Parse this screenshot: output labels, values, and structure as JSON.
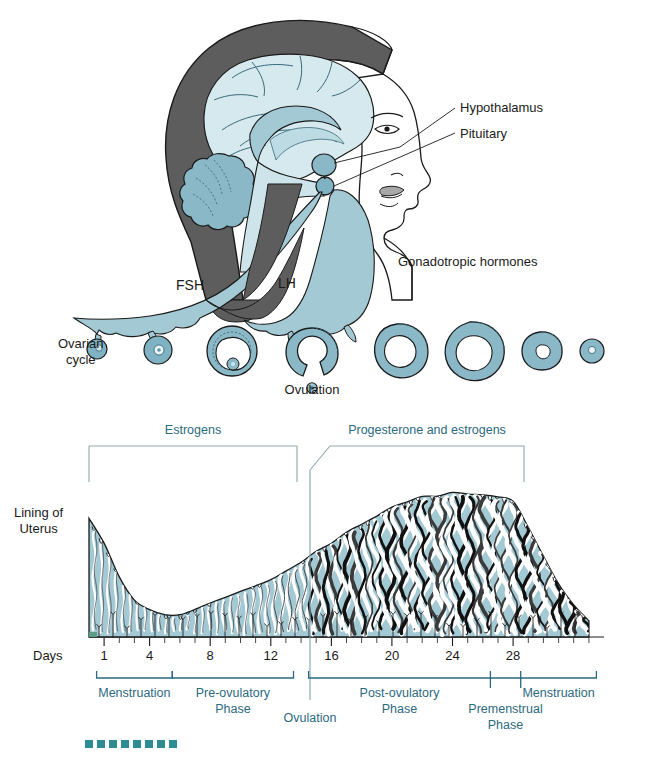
{
  "figure": {
    "colors": {
      "teal_fill": "#a3c9d4",
      "teal_mid": "#8ab8c6",
      "teal_dark": "#5d96a8",
      "brain_light": "#d6e9ef",
      "hair_gray": "#5d5d5d",
      "lip_gray": "#a8a8a8",
      "outline": "#1a1a1a",
      "label_blue": "#2b6a80",
      "bracket_gray": "#8fa8ae",
      "gland_black": "#111111"
    }
  },
  "upper_panel": {
    "labels": {
      "hypothalamus": "Hypothalamus",
      "pituitary": "Pituitary",
      "gonadotropic_hormones": "Gonadotropic hormones",
      "fsh": "FSH",
      "lh": "LH",
      "ovarian_cycle_line1": "Ovarian",
      "ovarian_cycle_line2": "cycle",
      "ovulation": "Ovulation"
    },
    "follicles": [
      {
        "stage": "primordial-follicle",
        "cx": 97,
        "r": 10
      },
      {
        "stage": "primary-follicle",
        "cx": 158,
        "r": 14
      },
      {
        "stage": "mature-graafian-follicle",
        "cx": 232,
        "r": 25
      },
      {
        "stage": "ruptured-follicle-ovulation",
        "cx": 312,
        "r": 24
      },
      {
        "stage": "early-corpus-luteum",
        "cx": 397,
        "r": 27
      },
      {
        "stage": "mature-corpus-luteum",
        "cx": 470,
        "r": 29
      },
      {
        "stage": "regressing-corpus-luteum",
        "cx": 540,
        "r": 20
      },
      {
        "stage": "corpus-albicans",
        "cx": 592,
        "r": 12
      }
    ]
  },
  "lower_panel": {
    "labels": {
      "lining_line1": "Lining of",
      "lining_line2": "Uterus",
      "estrogens": "Estrogens",
      "progesterone_and_estrogens": "Progesterone and estrogens",
      "days": "Days",
      "ovulation": "Ovulation"
    },
    "phases": [
      {
        "name": "Menstruation",
        "label": "Menstruation",
        "start_day": 1,
        "end_day": 5,
        "two_line": false
      },
      {
        "name": "Pre-ovulatory Phase",
        "label_line1": "Pre-ovulatory",
        "label_line2": "Phase",
        "start_day": 6,
        "end_day": 13,
        "two_line": true
      },
      {
        "name": "Post-ovulatory Phase",
        "label_line1": "Post-ovulatory",
        "label_line2": "Phase",
        "start_day": 15,
        "end_day": 26,
        "two_line": true
      },
      {
        "name": "Premenstrual Phase",
        "label_line1": "Premenstrual",
        "label_line2": "Phase",
        "start_day": 27,
        "end_day": 28,
        "two_line": true
      },
      {
        "name": "Menstruation",
        "label": "Menstruation",
        "start_day": 29,
        "end_day": 33,
        "two_line": false
      }
    ]
  },
  "chart_data": {
    "type": "area",
    "xlabel": "Days",
    "ylabel": "Endometrial thickness",
    "xlim": [
      0,
      34
    ],
    "ylim": [
      0,
      100
    ],
    "grid": false,
    "legend_position": "top",
    "tick_interval_days": 1,
    "x_tick_labels": [
      "1",
      "4",
      "8",
      "12",
      "16",
      "20",
      "24",
      "28"
    ],
    "x_tick_label_days": [
      1,
      4,
      8,
      12,
      16,
      20,
      24,
      28
    ],
    "annotations": [
      {
        "text": "Ovulation",
        "day": 14,
        "type": "vertical-line"
      },
      {
        "text": "Estrogens",
        "start_day": 1,
        "end_day": 13,
        "type": "bracket"
      },
      {
        "text": "Progesterone and estrogens",
        "start_day": 14,
        "end_day": 28,
        "type": "bracket"
      }
    ],
    "series": [
      {
        "name": "Endometrial thickness",
        "x": [
          0,
          1,
          2,
          3,
          4,
          5,
          6,
          7,
          8,
          9,
          10,
          11,
          12,
          13,
          14,
          15,
          16,
          17,
          18,
          19,
          20,
          21,
          22,
          23,
          24,
          25,
          26,
          27,
          28,
          29,
          30,
          31,
          32,
          33
        ],
        "values": [
          78,
          62,
          40,
          25,
          17,
          14,
          15,
          18,
          22,
          26,
          30,
          34,
          38,
          43,
          48,
          55,
          62,
          68,
          74,
          79,
          84,
          88,
          91,
          93,
          94,
          94,
          93,
          92,
          88,
          72,
          52,
          34,
          20,
          10
        ]
      }
    ]
  }
}
